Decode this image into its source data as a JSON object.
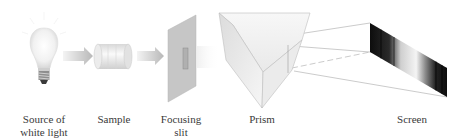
{
  "diagram": {
    "type": "spectroscope-schematic",
    "components": [
      {
        "id": "source",
        "label_lines": [
          "Source of",
          "white light"
        ],
        "icon": "light-bulb-icon"
      },
      {
        "id": "sample",
        "label_lines": [
          "Sample"
        ],
        "icon": "sample-cell-icon"
      },
      {
        "id": "slit",
        "label_lines": [
          "Focusing",
          "slit"
        ],
        "icon": "slit-plate-icon"
      },
      {
        "id": "prism",
        "label_lines": [
          "Prism"
        ],
        "icon": "prism-icon"
      },
      {
        "id": "screen",
        "label_lines": [
          "Screen"
        ],
        "icon": "spectrum-screen-icon"
      }
    ],
    "arrows": [
      {
        "from": "source",
        "to": "sample",
        "icon": "arrow-right-icon"
      },
      {
        "from": "sample",
        "to": "slit",
        "icon": "arrow-right-icon"
      }
    ],
    "colors": {
      "label_text": "#3a3a3a",
      "arrow": "#bdbdbd",
      "slit_plate": "#c8c8c8",
      "prism_edge": "#9a9a9a",
      "ray_line": "#a0a0a0",
      "spectrum_dark": "#111111",
      "spectrum_light": "#f2f2f2"
    }
  }
}
